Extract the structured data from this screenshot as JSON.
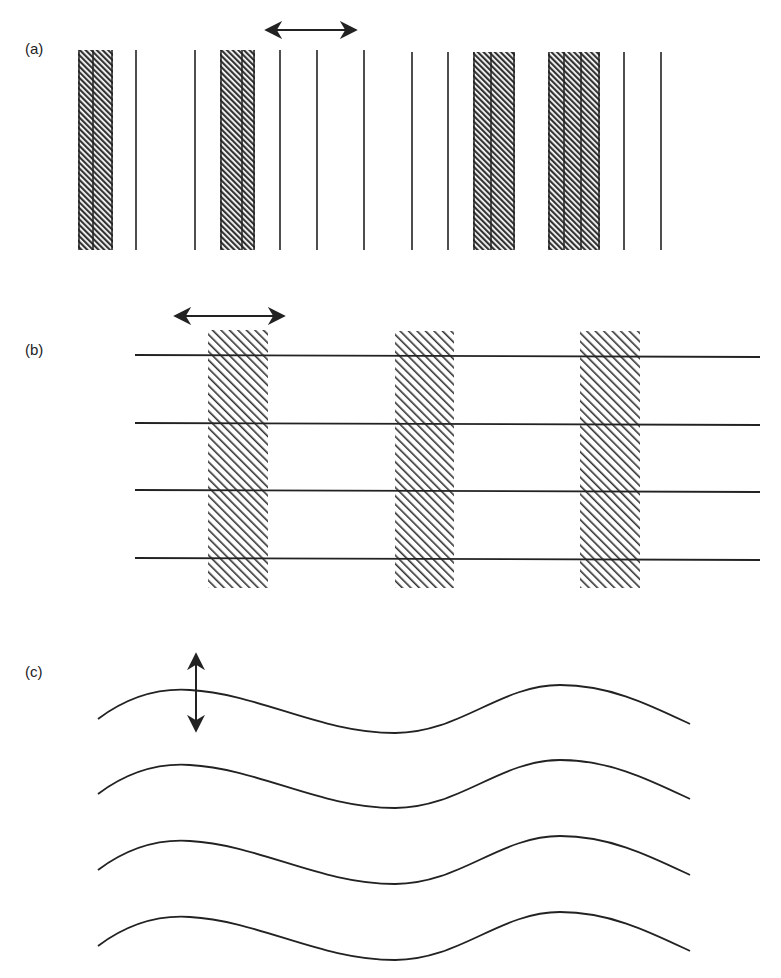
{
  "panels": [
    {
      "label": "(a)",
      "description": "vertical lines with dense hatched bands, horizontal double arrow"
    },
    {
      "label": "(b)",
      "description": "horizontal lines crossed by vertical hatched bands, horizontal double arrow"
    },
    {
      "label": "(c)",
      "description": "four parallel sinusoidal waves, vertical double arrow"
    }
  ],
  "colors": {
    "ink": "#222222",
    "hatch": "#333333",
    "background": "#ffffff"
  }
}
